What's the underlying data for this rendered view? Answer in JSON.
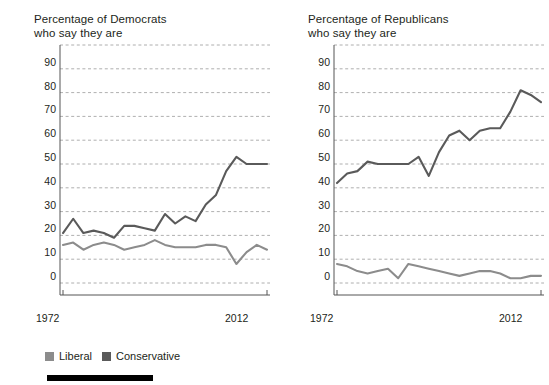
{
  "panels": [
    {
      "id": "democrats",
      "title": "Percentage of Democrats\nwho say they are",
      "x_start_label": "1972",
      "x_end_label": "2012"
    },
    {
      "id": "republicans",
      "title": "Percentage of Republicans\nwho say they are",
      "x_start_label": "1972",
      "x_end_label": "2012"
    }
  ],
  "legend": {
    "items": [
      {
        "label": "Liberal",
        "color": "#8c8c8c"
      },
      {
        "label": "Conservative",
        "color": "#5a5a5a"
      }
    ]
  },
  "colors": {
    "liberal": "#8c8c8c",
    "conservative": "#5a5a5a",
    "axis": "#555555",
    "gridline": "#9a9a9a",
    "text": "#231f20",
    "rule": "#000000"
  },
  "chart_data": [
    {
      "type": "line",
      "title": "Percentage of Democrats who say they are",
      "xlabel": "",
      "ylabel": "",
      "xlim": [
        1972,
        2012
      ],
      "ylim": [
        0,
        100
      ],
      "yticks": [
        0,
        10,
        20,
        30,
        40,
        50,
        60,
        70,
        80,
        90
      ],
      "xticks": [
        1972,
        2012
      ],
      "xtick_labels": [
        "1972",
        "2012"
      ],
      "grid": true,
      "legend_position": "bottom",
      "x": [
        1972,
        1974,
        1976,
        1978,
        1980,
        1982,
        1984,
        1986,
        1988,
        1990,
        1992,
        1994,
        1996,
        1998,
        2000,
        2002,
        2004,
        2006,
        2008,
        2010,
        2012
      ],
      "series": [
        {
          "name": "Liberal",
          "color": "#8c8c8c",
          "values": [
            16,
            17,
            14,
            16,
            17,
            16,
            14,
            15,
            16,
            18,
            16,
            15,
            15,
            15,
            16,
            16,
            15,
            8,
            13,
            16,
            14
          ]
        },
        {
          "name": "Conservative",
          "color": "#5a5a5a",
          "values": [
            21,
            27,
            21,
            22,
            21,
            19,
            24,
            24,
            23,
            22,
            29,
            25,
            28,
            26,
            33,
            37,
            47,
            53,
            50,
            50,
            50
          ]
        }
      ]
    },
    {
      "type": "line",
      "title": "Percentage of Republicans who say they are",
      "xlabel": "",
      "ylabel": "",
      "xlim": [
        1972,
        2012
      ],
      "ylim": [
        0,
        100
      ],
      "yticks": [
        0,
        10,
        20,
        30,
        40,
        50,
        60,
        70,
        80,
        90
      ],
      "xticks": [
        1972,
        2012
      ],
      "xtick_labels": [
        "1972",
        "2012"
      ],
      "grid": true,
      "legend_position": "bottom",
      "x": [
        1972,
        1974,
        1976,
        1978,
        1980,
        1982,
        1984,
        1986,
        1988,
        1990,
        1992,
        1994,
        1996,
        1998,
        2000,
        2002,
        2004,
        2006,
        2008,
        2010,
        2012
      ],
      "series": [
        {
          "name": "Liberal",
          "color": "#8c8c8c",
          "values": [
            8,
            7,
            5,
            4,
            5,
            6,
            2,
            8,
            7,
            6,
            5,
            4,
            3,
            4,
            5,
            5,
            4,
            2,
            2,
            3,
            3
          ]
        },
        {
          "name": "Conservative",
          "color": "#5a5a5a",
          "values": [
            42,
            46,
            47,
            51,
            50,
            50,
            50,
            50,
            53,
            45,
            55,
            62,
            64,
            60,
            64,
            65,
            65,
            72,
            81,
            79,
            76
          ]
        }
      ]
    }
  ]
}
